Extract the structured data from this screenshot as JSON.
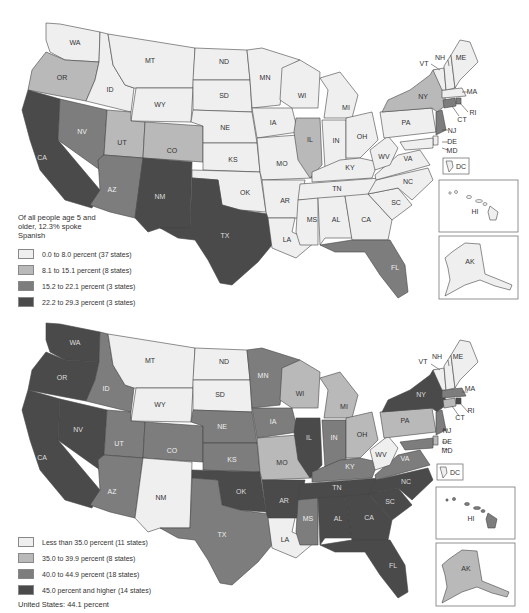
{
  "top_map": {
    "caption": "Of all people age 5 and older, 12.3% spoke Spanish",
    "legend": [
      {
        "label": "0.0 to 8.0 percent (37 states)",
        "color": "#efefef"
      },
      {
        "label": "8.1 to 15.1 percent (8 states)",
        "color": "#b9b9b9"
      },
      {
        "label": "15.2 to 22.1 percent (3 states)",
        "color": "#7d7d7d"
      },
      {
        "label": "22.2 to 29.3 percent (3 states)",
        "color": "#4a4a4a"
      }
    ],
    "state_labels": {
      "WA": "WA",
      "OR": "OR",
      "CA": "CA",
      "ID": "ID",
      "NV": "NV",
      "MT": "MT",
      "WY": "WY",
      "UT": "UT",
      "AZ": "AZ",
      "CO": "CO",
      "NM": "NM",
      "ND": "ND",
      "SD": "SD",
      "NE": "NE",
      "KS": "KS",
      "OK": "OK",
      "TX": "TX",
      "MN": "MN",
      "IA": "IA",
      "MO": "MO",
      "AR": "AR",
      "LA": "LA",
      "WI": "WI",
      "IL": "IL",
      "MI": "MI",
      "IN": "IN",
      "OH": "OH",
      "KY": "KY",
      "TN": "TN",
      "MS": "MS",
      "AL": "AL",
      "GA": "CA",
      "FL": "FL",
      "SC": "SC",
      "NC": "NC",
      "VA": "VA",
      "WV": "WV",
      "PA": "PA",
      "NY": "NY",
      "VT": "VT",
      "NH": "NH",
      "ME": "ME",
      "MA": "MA",
      "RI": "RI",
      "CT": "CT",
      "NJ": "NJ",
      "DE": "DE",
      "MD": "MD",
      "DC": "DC",
      "HI": "HI",
      "AK": "AK"
    }
  },
  "bottom_map": {
    "legend": [
      {
        "label": "Less than 35.0 percent (11 states)",
        "color": "#efefef"
      },
      {
        "label": "35.0 to 39.9 percent (8 states)",
        "color": "#b9b9b9"
      },
      {
        "label": "40.0 to 44.9 percent (18 states)",
        "color": "#7d7d7d"
      },
      {
        "label": "45.0 percent and higher (14 states)",
        "color": "#4a4a4a"
      }
    ],
    "us_total": "United States: 44.1 percent",
    "state_labels": {
      "WA": "WA",
      "OR": "OR",
      "CA": "CA",
      "ID": "ID",
      "NV": "NV",
      "MT": "MT",
      "WY": "WY",
      "UT": "UT",
      "AZ": "AZ",
      "CO": "CO",
      "NM": "NM",
      "ND": "ND",
      "SD": "SD",
      "NE": "NE",
      "KS": "KS",
      "OK": "OK",
      "TX": "TX",
      "MN": "MN",
      "IA": "IA",
      "MO": "MO",
      "AR": "AR",
      "LA": "LA",
      "WI": "WI",
      "IL": "IL",
      "MI": "MI",
      "IN": "IN",
      "OH": "OH",
      "KY": "KY",
      "TN": "TN",
      "MS": "MS",
      "AL": "AL",
      "GA": "CA",
      "FL": "FL",
      "SC": "SC",
      "NC": "NC",
      "VA": "VA",
      "WV": "WV",
      "PA": "PA",
      "NY": "NY",
      "VT": "VT",
      "NH": "NH",
      "ME": "ME",
      "MA": "MA",
      "RI": "RI",
      "CT": "CT",
      "NJ": "NJ",
      "DE": "DE",
      "MD": "MD",
      "DC": "DC",
      "HI": "HI",
      "AK": "AK"
    }
  },
  "colors": {
    "class1": "#efefef",
    "class2": "#b9b9b9",
    "class3": "#7d7d7d",
    "class4": "#4a4a4a",
    "border": "#444444"
  }
}
